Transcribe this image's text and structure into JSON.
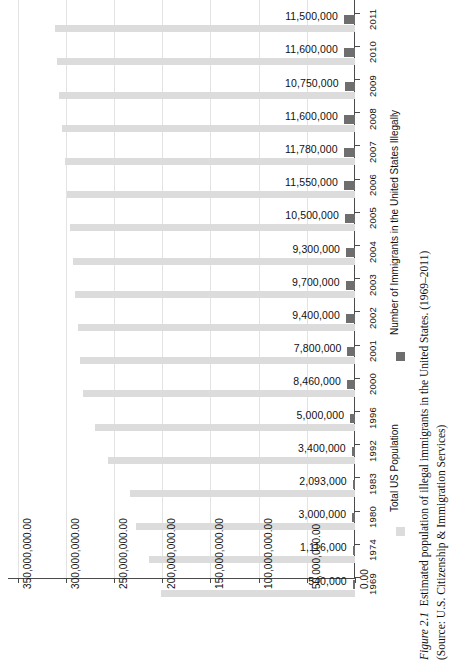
{
  "chart_data": {
    "type": "bar",
    "orientation": "horizontal-rotated",
    "title": "",
    "xlabel": "",
    "ylabel": "",
    "categories": [
      "2011",
      "2010",
      "2009",
      "2008",
      "2007",
      "2006",
      "2005",
      "2004",
      "2003",
      "2002",
      "2001",
      "2000",
      "1996",
      "1992",
      "1983",
      "1980",
      "1974",
      "1969"
    ],
    "series": [
      {
        "name": "Number of Immigrants in the United States Illegally",
        "color": "#6e6e6e",
        "values": [
          11500000,
          11600000,
          10750000,
          11600000,
          11780000,
          11550000,
          10500000,
          9300000,
          9700000,
          9400000,
          7800000,
          8460000,
          5000000,
          3400000,
          2093000,
          3000000,
          1116000,
          540000
        ],
        "labels": [
          "11,500,000",
          "11,600,000",
          "10,750,000",
          "11,600,000",
          "11,780,000",
          "11,550,000",
          "10,500,000",
          "9,300,000",
          "9,700,000",
          "9,400,000",
          "7,800,000",
          "8,460,000",
          "5,000,000",
          "3,400,000",
          "2,093,000",
          "3,000,000",
          "1,116,000",
          "540,000"
        ]
      },
      {
        "name": "Total US Population",
        "color": "#dcdcdc",
        "values": [
          311590000,
          309330000,
          306770000,
          304090000,
          301230000,
          298380000,
          295520000,
          292810000,
          290110000,
          287630000,
          284970000,
          282160000,
          269390000,
          256510000,
          233790000,
          227220000,
          213850000,
          201300000
        ]
      }
    ],
    "value_axis_ticks": [
      "350,000,000.00",
      "300,000,000.00",
      "250,000,000.00",
      "200,000,000.00",
      "150,000,000.00",
      "100,000,000.00",
      "50,000,000.00",
      "0.00"
    ],
    "value_axis_tick_values": [
      350000000,
      300000000,
      250000000,
      200000000,
      150000000,
      100000000,
      50000000,
      0
    ],
    "xlim": [
      0,
      360000000
    ],
    "grid": true,
    "legend_position": "right"
  },
  "legend": {
    "items": [
      {
        "label": "Number of Immigrants in the United States Illegally",
        "color": "#6e6e6e"
      },
      {
        "label": "Total US Population",
        "color": "#dcdcdc"
      }
    ]
  },
  "caption": {
    "figure_number": "Figure 2.1",
    "figure_text": "Estimated population of illegal immigrants in the United States. (1969–2011)",
    "source": "(Source: U.S. Citizenship & Immigration Services)"
  }
}
